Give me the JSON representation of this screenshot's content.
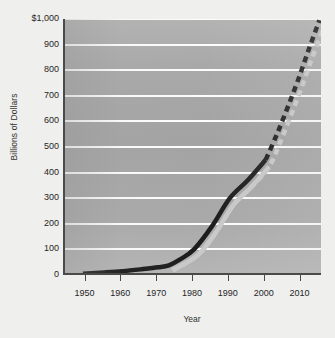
{
  "chart_data": {
    "type": "line",
    "title": "",
    "xlabel": "Year",
    "ylabel": "Billions of Dollars",
    "xlim": [
      1944,
      2016
    ],
    "ylim": [
      0,
      1000
    ],
    "grid": true,
    "legend": "none",
    "xticks": [
      1950,
      1960,
      1970,
      1980,
      1990,
      2000,
      2010
    ],
    "xtick_labels": [
      "1950",
      "1960",
      "1970",
      "1980",
      "1990",
      "2000",
      "2010"
    ],
    "yticks": [
      0,
      100,
      200,
      300,
      400,
      500,
      600,
      700,
      800,
      900,
      1000
    ],
    "ytick_labels": [
      "0",
      "100",
      "200",
      "300",
      "400",
      "500",
      "600",
      "700",
      "800",
      "900",
      "$1,000"
    ],
    "series": [
      {
        "name": "Actual",
        "style": "solid",
        "color": "#1c1c1c",
        "width": 4.5,
        "x": [
          1949,
          1955,
          1960,
          1965,
          1970,
          1973,
          1976,
          1980,
          1985,
          1990,
          1995,
          2000
        ],
        "values": [
          5,
          10,
          15,
          22,
          30,
          38,
          60,
          100,
          190,
          300,
          370,
          450
        ]
      },
      {
        "name": "Projected",
        "style": "dashed",
        "color": "#1c1c1c",
        "width": 4.5,
        "x": [
          2000,
          2003,
          2006,
          2009,
          2012,
          2015
        ],
        "values": [
          450,
          545,
          650,
          760,
          880,
          995
        ]
      },
      {
        "name": "Shadow",
        "style": "shadow",
        "color": "#c9c9c9",
        "width": 4.5,
        "x": [
          1973,
          1980,
          1985,
          1990,
          1995,
          2000,
          2003,
          2006,
          2009,
          2012,
          2015
        ],
        "values": [
          30,
          88,
          175,
          285,
          355,
          435,
          528,
          632,
          742,
          860,
          968
        ]
      }
    ]
  },
  "figure": {
    "background_color": "#efefee",
    "plot_background_color": "#a8a8a8",
    "gridline_color": "#fdfdfd",
    "axis_color": "#4a4a4a"
  }
}
